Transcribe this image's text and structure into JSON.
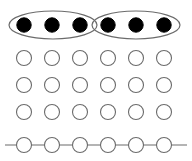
{
  "figure": {
    "canvas": {
      "width": 192,
      "height": 161,
      "background": "#ffffff"
    },
    "style": {
      "open_circle_fill": "#ffffff",
      "open_circle_stroke": "#6b6b6b",
      "filled_circle_fill": "#000000",
      "ellipse_stroke": "#6b6b6b",
      "line_stroke": "#6b6b6b",
      "circle_radius": 7.5,
      "filled_circle_radius": 7.2,
      "stroke_width": 1.1
    },
    "columns": {
      "count": 6,
      "centers_x": [
        24,
        52,
        80,
        108,
        136,
        164
      ]
    },
    "rows": [
      {
        "index": 0,
        "center_y": 25,
        "state": "filled",
        "circle_count": 6
      },
      {
        "index": 1,
        "center_y": 58,
        "state": "open",
        "circle_count": 6
      },
      {
        "index": 2,
        "center_y": 85,
        "state": "open",
        "circle_count": 6
      },
      {
        "index": 3,
        "center_y": 112,
        "state": "open",
        "circle_count": 6
      },
      {
        "index": 4,
        "center_y": 145,
        "state": "open",
        "circle_count": 6
      }
    ],
    "ellipses": [
      {
        "name": "left-group",
        "cx": 53,
        "cy": 25,
        "rx": 44,
        "ry": 14,
        "covers_columns": [
          0,
          1,
          2
        ]
      },
      {
        "name": "right-group",
        "cx": 136,
        "cy": 25,
        "rx": 44,
        "ry": 14,
        "covers_columns": [
          3,
          4,
          5
        ]
      }
    ],
    "baseline": {
      "name": "horizontal-axis",
      "x1": 5,
      "y1": 145,
      "x2": 187,
      "y2": 145
    }
  }
}
